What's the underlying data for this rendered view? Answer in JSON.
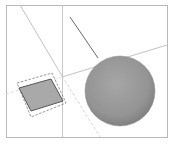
{
  "viewport": {
    "background": "#ffffff",
    "frame": {
      "x": 6,
      "y": 5,
      "w": 161,
      "h": 132,
      "color": "#b8b8b8"
    },
    "axis_color": "#c9c9c9",
    "edge_color": "#6a6a6a"
  },
  "scene": {
    "square": {
      "label": "selected-face",
      "fill": "#a9a9a9",
      "stroke": "#555555",
      "points": "19,87 52,79 63,101 30,111"
    },
    "selection_box": {
      "color": "#7a7a7a",
      "points": "17,83 52,73 66,103 31,117"
    },
    "sphere": {
      "cx": 120,
      "cy": 91,
      "r": 35,
      "light": "#a3a3a3",
      "dark": "#7d7d7d"
    },
    "edge_line": {
      "x1": 70,
      "y1": 17,
      "x2": 98,
      "y2": 58
    }
  }
}
